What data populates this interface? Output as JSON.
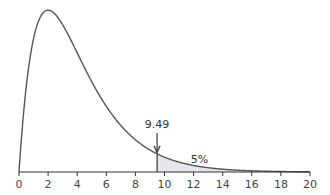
{
  "chart_data": {
    "type": "area",
    "title": "",
    "xlabel": "",
    "ylabel": "",
    "distribution": "chi-square, df = 4",
    "xlim": [
      0,
      20
    ],
    "grid": false,
    "x_ticks": [
      0,
      2,
      4,
      6,
      8,
      10,
      12,
      14,
      16,
      18,
      20
    ],
    "tick_labels": [
      "0",
      "2",
      "4",
      "6",
      "8",
      "10",
      "12",
      "14",
      "16",
      "18",
      "20"
    ],
    "critical_value": 9.49,
    "critical_label": "9.49",
    "shaded_region": {
      "from": 9.49,
      "to": 20,
      "label": "5%"
    },
    "colors": {
      "curve": "#555555",
      "shade": "#e4e6ea",
      "axis": "#333333"
    }
  }
}
